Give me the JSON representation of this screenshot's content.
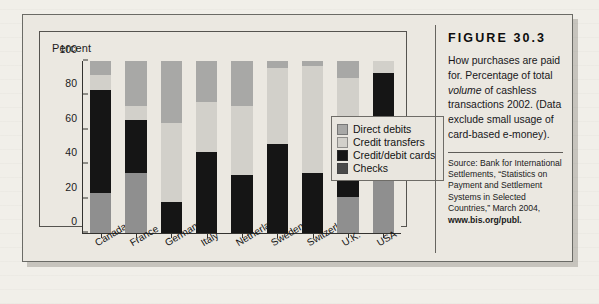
{
  "figure": {
    "label": "FIGURE  30.3",
    "description_part1": "How purchases are paid for. Percentage of total ",
    "description_emphasis": "volume",
    "description_part2": " of cashless transactions 2002. (Data exclude small usage of card-based e-money).",
    "source_text": "Source: Bank for International Settlements, “Statistics on Payment and Settlement Systems in Selected Countries,” March 2004,",
    "source_url": "www.bis.org/publ."
  },
  "chart_data": {
    "type": "bar",
    "stacked": true,
    "title": "",
    "xlabel": "",
    "ylabel": "Percent",
    "ylim": [
      0,
      100
    ],
    "yticks": [
      0,
      20,
      40,
      60,
      80,
      100
    ],
    "grid": false,
    "legend_position": "inside-right",
    "categories": [
      "Canada",
      "France",
      "Germany",
      "Italy",
      "Netherlands",
      "Sweden",
      "Switzerland",
      "U.K.",
      "USA"
    ],
    "series": [
      {
        "name": "Checks",
        "color": "#8f8f8f",
        "values": [
          23,
          35,
          0,
          0,
          0,
          0,
          0,
          21,
          51
        ]
      },
      {
        "name": "Credit/debit cards",
        "color": "#151515",
        "values": [
          60,
          31,
          18,
          47,
          34,
          52,
          35,
          42,
          42
        ]
      },
      {
        "name": "Credit transfers",
        "color": "#d2d0ca",
        "values": [
          9,
          8,
          46,
          29,
          40,
          44,
          62,
          27,
          7
        ]
      },
      {
        "name": "Direct debits",
        "color": "#a8a8a6",
        "values": [
          8,
          26,
          36,
          24,
          26,
          4,
          3,
          10,
          0
        ]
      }
    ]
  },
  "legend": {
    "items": [
      {
        "label": "Direct debits",
        "color": "#a8a8a6"
      },
      {
        "label": "Credit transfers",
        "color": "#d2d0ca"
      },
      {
        "label": "Credit/debit cards",
        "color": "#151515"
      },
      {
        "label": "Checks",
        "color": "#4a4a4a"
      }
    ]
  }
}
